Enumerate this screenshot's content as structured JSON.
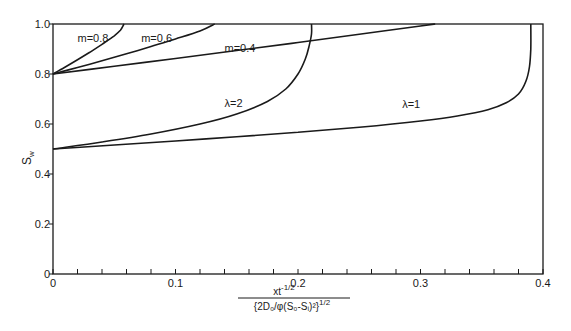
{
  "chart_data": {
    "type": "line",
    "title": "",
    "xlabel": "x t^(-1/2) / {2D0/φ(S0-Si)^2}^(1/2)",
    "xlabel_numerator": "xt",
    "xlabel_numerator_exp": "-1/2",
    "xlabel_denominator": "{2D₀/φ(S₀-Sᵢ)²}",
    "xlabel_denominator_exp": "1/2",
    "ylabel": "S",
    "ylabel_sub": "w",
    "xlim": [
      0,
      0.4
    ],
    "ylim": [
      0,
      1.0
    ],
    "x_ticks": [
      {
        "value": 0,
        "label": "0"
      },
      {
        "value": 0.1,
        "label": "0.1"
      },
      {
        "value": 0.2,
        "label": "0.2"
      },
      {
        "value": 0.3,
        "label": "0.3"
      },
      {
        "value": 0.4,
        "label": "0.4"
      }
    ],
    "x_minor_step": 0.02,
    "y_ticks": [
      {
        "value": 0,
        "label": "0"
      },
      {
        "value": 0.2,
        "label": "0.2"
      },
      {
        "value": 0.4,
        "label": "0.4"
      },
      {
        "value": 0.6,
        "label": "0.6"
      },
      {
        "value": 0.8,
        "label": "0.8"
      },
      {
        "value": 1.0,
        "label": "1.0"
      }
    ],
    "grid": false,
    "legend": "inline labels",
    "series": [
      {
        "name": "m=0.8",
        "label": "m=0.8",
        "label_pos": [
          0.02,
          0.93
        ],
        "x": [
          0,
          0.01,
          0.02,
          0.03,
          0.04,
          0.05,
          0.055,
          0.058
        ],
        "y": [
          0.8,
          0.828,
          0.857,
          0.887,
          0.919,
          0.953,
          0.975,
          1.0
        ]
      },
      {
        "name": "m=0.6",
        "label": "m=0.6",
        "label_pos": [
          0.072,
          0.93
        ],
        "x": [
          0,
          0.02,
          0.04,
          0.06,
          0.08,
          0.1,
          0.12,
          0.132
        ],
        "y": [
          0.8,
          0.826,
          0.853,
          0.881,
          0.91,
          0.94,
          0.972,
          1.0
        ]
      },
      {
        "name": "m=0.4",
        "label": "m=0.4",
        "label_pos": [
          0.14,
          0.89
        ],
        "x": [
          0,
          0.05,
          0.1,
          0.15,
          0.2,
          0.25,
          0.3,
          0.312
        ],
        "y": [
          0.8,
          0.831,
          0.862,
          0.894,
          0.926,
          0.959,
          0.992,
          1.0
        ]
      },
      {
        "name": "λ=2",
        "label": "λ=2",
        "label_pos": [
          0.14,
          0.67
        ],
        "x": [
          0,
          0.04,
          0.08,
          0.12,
          0.15,
          0.175,
          0.19,
          0.2,
          0.206,
          0.209,
          0.211,
          0.211
        ],
        "y": [
          0.5,
          0.528,
          0.56,
          0.6,
          0.64,
          0.69,
          0.74,
          0.8,
          0.86,
          0.91,
          0.96,
          1.0
        ]
      },
      {
        "name": "λ=1",
        "label": "λ=1",
        "label_pos": [
          0.285,
          0.665
        ],
        "x": [
          0,
          0.05,
          0.1,
          0.15,
          0.2,
          0.25,
          0.3,
          0.33,
          0.355,
          0.37,
          0.38,
          0.386,
          0.389,
          0.39,
          0.39
        ],
        "y": [
          0.5,
          0.516,
          0.532,
          0.549,
          0.567,
          0.587,
          0.612,
          0.632,
          0.657,
          0.685,
          0.72,
          0.77,
          0.83,
          0.9,
          1.0
        ]
      }
    ]
  }
}
